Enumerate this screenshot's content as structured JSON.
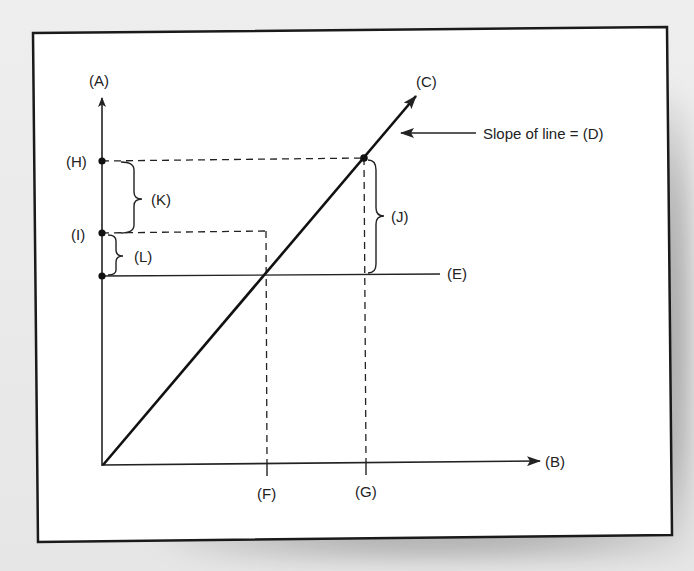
{
  "diagram": {
    "axes": {
      "y_label": "(A)",
      "x_label": "(B)"
    },
    "line": {
      "label": "(C)",
      "slope_annotation": "Slope of line = (D)"
    },
    "horizontal_line": {
      "label": "(E)"
    },
    "x_points": [
      {
        "label": "(F)"
      },
      {
        "label": "(G)"
      }
    ],
    "y_points": [
      {
        "label": "(H)"
      },
      {
        "label": "(I)"
      }
    ],
    "braces": [
      {
        "label": "(J)"
      },
      {
        "label": "(K)"
      },
      {
        "label": "(L)"
      }
    ],
    "colors": {
      "frame": "#1a1a1a",
      "ink": "#222222",
      "paper": "#ffffff",
      "background": "#e9e9e9"
    }
  }
}
